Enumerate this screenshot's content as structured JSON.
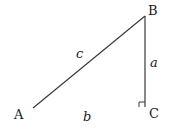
{
  "diagram": {
    "type": "right-triangle",
    "vertices": {
      "A": {
        "label": "A"
      },
      "B": {
        "label": "B"
      },
      "C": {
        "label": "C"
      }
    },
    "sides": {
      "a": {
        "label": "a",
        "between": "B-C"
      },
      "b": {
        "label": "b",
        "between": "A-C"
      },
      "c": {
        "label": "c",
        "between": "A-B"
      }
    },
    "right_angle_at": "C",
    "colors": {
      "line": "#3a3a3a",
      "text": "#222222"
    }
  }
}
